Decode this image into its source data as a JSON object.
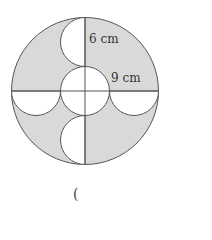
{
  "figure": {
    "labels": {
      "top": "6 cm",
      "right": "9 cm"
    },
    "answer_paren": "(",
    "colors": {
      "shade": "#d9d9d9",
      "stroke": "#555555",
      "text": "#333333"
    }
  }
}
